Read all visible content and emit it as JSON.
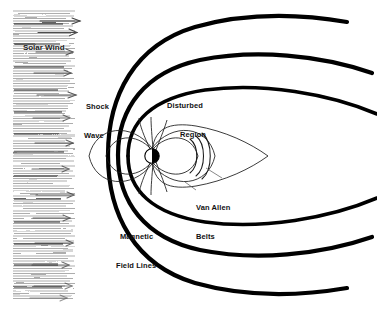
{
  "figure": {
    "background_color": "#ffffff",
    "line_color": "#000000",
    "width": 377,
    "height": 311
  },
  "labels": {
    "solar_wind": "Solar Wind",
    "shock_wave_line1": "Shock",
    "shock_wave_line2": "Wave",
    "disturbed_region_line1": "Disturbed",
    "disturbed_region_line2": "Region",
    "van_allen_line1": "Van Allen",
    "van_allen_line2": "Belts",
    "magnetic_field_line1": "Magnetic",
    "magnetic_field_line2": "Field Lines"
  },
  "elements": {
    "planet_name": "Earth",
    "planet_center_x": 152,
    "planet_center_y": 156,
    "planet_radius": 7,
    "solar_wind_band_left": 13,
    "solar_wind_band_right": 75,
    "solar_wind_arrow_count": 14,
    "bow_shock_curve_count": 2,
    "magnetopause_curve_count": 1,
    "van_allen_arc_count": 3,
    "dipole_loop_count": 3
  }
}
